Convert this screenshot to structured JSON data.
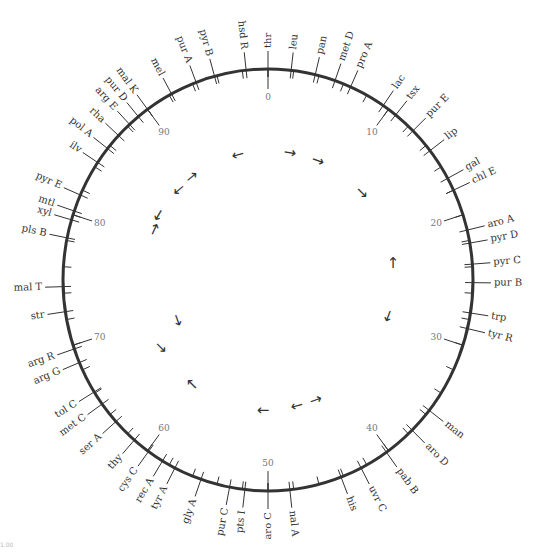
{
  "figure": {
    "center": [
      268,
      280
    ],
    "radius_x": 205,
    "radius_y": 211,
    "total_units": 100,
    "circle_color": "#333333",
    "text_color": "#333333",
    "scale_color": "#777777",
    "minor_tick_step": 2,
    "scale_labels": [
      {
        "value": 0,
        "label": "0"
      },
      {
        "value": 10,
        "label": "10"
      },
      {
        "value": 20,
        "label": "20"
      },
      {
        "value": 30,
        "label": "30"
      },
      {
        "value": 40,
        "label": "40"
      },
      {
        "value": 50,
        "label": "50"
      },
      {
        "value": 60,
        "label": "60"
      },
      {
        "value": 70,
        "label": "70"
      },
      {
        "value": 80,
        "label": "80"
      },
      {
        "value": 90,
        "label": "90"
      }
    ],
    "genes": [
      {
        "name": "thr",
        "pos": 0
      },
      {
        "name": "leu",
        "pos": 1.8
      },
      {
        "name": "pan",
        "pos": 3.7
      },
      {
        "name": "met D",
        "pos": 5.3
      },
      {
        "name": "pro A",
        "pos": 6.6
      },
      {
        "name": "lac",
        "pos": 9.5
      },
      {
        "name": "tsx",
        "pos": 10.7
      },
      {
        "name": "pur E",
        "pos": 12.5
      },
      {
        "name": "lip",
        "pos": 14.5
      },
      {
        "name": "gal",
        "pos": 17.0
      },
      {
        "name": "chl E",
        "pos": 18.0
      },
      {
        "name": "aro A",
        "pos": 21.2
      },
      {
        "name": "pyr D",
        "pos": 22.2
      },
      {
        "name": "pyr C",
        "pos": 23.8
      },
      {
        "name": "pur B",
        "pos": 25.2
      },
      {
        "name": "trp",
        "pos": 27.5
      },
      {
        "name": "tyr R",
        "pos": 28.7
      },
      {
        "name": "man",
        "pos": 35.6
      },
      {
        "name": "aro D",
        "pos": 37.6
      },
      {
        "name": "pab B",
        "pos": 40.2
      },
      {
        "name": "uvr C",
        "pos": 42.5
      },
      {
        "name": "his",
        "pos": 44.2
      },
      {
        "name": "nal A",
        "pos": 48.3
      },
      {
        "name": "aro C",
        "pos": 50.0
      },
      {
        "name": "pts I",
        "pos": 51.8
      },
      {
        "name": "pur C",
        "pos": 53.0
      },
      {
        "name": "gly A",
        "pos": 55.3
      },
      {
        "name": "tyr A",
        "pos": 57.5
      },
      {
        "name": "rec A",
        "pos": 58.6
      },
      {
        "name": "cys C",
        "pos": 59.9
      },
      {
        "name": "thy",
        "pos": 61.3
      },
      {
        "name": "ser A",
        "pos": 63.3
      },
      {
        "name": "met C",
        "pos": 65.0
      },
      {
        "name": "tol C",
        "pos": 66.1
      },
      {
        "name": "arg G",
        "pos": 68.6
      },
      {
        "name": "arg R",
        "pos": 69.7
      },
      {
        "name": "str",
        "pos": 72.6
      },
      {
        "name": "mal T",
        "pos": 74.5
      },
      {
        "name": "pls B",
        "pos": 78.2
      },
      {
        "name": "xyl",
        "pos": 79.6
      },
      {
        "name": "mtl",
        "pos": 80.3
      },
      {
        "name": "pyr E",
        "pos": 81.6
      },
      {
        "name": "ilv",
        "pos": 84.4
      },
      {
        "name": "pol A",
        "pos": 85.7
      },
      {
        "name": "rha",
        "pos": 87.0
      },
      {
        "name": "arg E",
        "pos": 88.2
      },
      {
        "name": "pur D",
        "pos": 89.1
      },
      {
        "name": "mal K",
        "pos": 90.0
      },
      {
        "name": "mel",
        "pos": 92.2
      },
      {
        "name": "pur A",
        "pos": 94.3
      },
      {
        "name": "pyr B",
        "pos": 95.8
      },
      {
        "name": "hsd R",
        "pos": 98.3
      }
    ],
    "arrows": [
      {
        "x": 238,
        "y": 155,
        "glyph": "←",
        "rot": -15
      },
      {
        "x": 290,
        "y": 153,
        "glyph": "→",
        "rot": 10
      },
      {
        "x": 318,
        "y": 161,
        "glyph": "→",
        "rot": 20
      },
      {
        "x": 362,
        "y": 193,
        "glyph": "→",
        "rot": 45
      },
      {
        "x": 192,
        "y": 177,
        "glyph": "→",
        "rot": -40
      },
      {
        "x": 179,
        "y": 190,
        "glyph": "←",
        "rot": -40
      },
      {
        "x": 158,
        "y": 216,
        "glyph": "↓",
        "rot": 30
      },
      {
        "x": 154,
        "y": 230,
        "glyph": "↑",
        "rot": 25
      },
      {
        "x": 393,
        "y": 263,
        "glyph": "↑",
        "rot": 0
      },
      {
        "x": 388,
        "y": 317,
        "glyph": "↓",
        "rot": 20
      },
      {
        "x": 178,
        "y": 321,
        "glyph": "↓",
        "rot": -20
      },
      {
        "x": 161,
        "y": 347,
        "glyph": "↘",
        "rot": 0
      },
      {
        "x": 192,
        "y": 384,
        "glyph": "↖",
        "rot": 0
      },
      {
        "x": 263,
        "y": 410,
        "glyph": "←",
        "rot": 0
      },
      {
        "x": 297,
        "y": 406,
        "glyph": "←",
        "rot": -15
      },
      {
        "x": 316,
        "y": 400,
        "glyph": "→",
        "rot": -20
      }
    ],
    "footer_note": "1.00"
  }
}
